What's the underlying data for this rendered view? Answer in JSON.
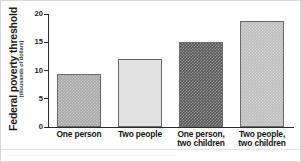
{
  "chart_data": {
    "type": "bar",
    "title": "",
    "subtitle": "",
    "xlabel": "",
    "ylabel": "Federal poverty threshold",
    "ylabel_sub": "(thousands of dollars)",
    "categories": [
      "One person",
      "Two people",
      "One person, two children",
      "Two people, two children"
    ],
    "category_lines": [
      [
        "One person",
        ""
      ],
      [
        "Two people",
        ""
      ],
      [
        "One person,",
        "two children"
      ],
      [
        "Two people,",
        "two children"
      ]
    ],
    "values": [
      9.4,
      12.0,
      15.0,
      18.7
    ],
    "ylim": [
      0,
      20
    ],
    "yticks": [
      0,
      5,
      10,
      15,
      20
    ],
    "ytick_labels": [
      "0",
      "5",
      "10",
      "15",
      "20"
    ],
    "grid": false,
    "legend": "none",
    "bar_colors": [
      "#a8a8a8",
      "#e2e2e2",
      "#595959",
      "#bdbdbd"
    ],
    "bar_textured": [
      true,
      false,
      true,
      true
    ],
    "bar_border_color": "#6a6a6a",
    "axis_color": "#2b2b2b",
    "frame_color": "#d9d9d9",
    "background": "#ffffff"
  },
  "caption": {
    "text": "·····················································································"
  }
}
